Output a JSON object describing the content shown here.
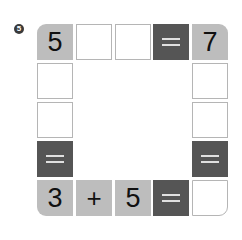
{
  "problem": {
    "number_badge": "5",
    "grid": {
      "rows": 5,
      "cols": 5,
      "cells": [
        {
          "row": 0,
          "col": 0,
          "type": "number",
          "value": "5",
          "corner": "tl"
        },
        {
          "row": 0,
          "col": 1,
          "type": "blank",
          "value": ""
        },
        {
          "row": 0,
          "col": 2,
          "type": "blank",
          "value": ""
        },
        {
          "row": 0,
          "col": 3,
          "type": "equals",
          "value": "="
        },
        {
          "row": 0,
          "col": 4,
          "type": "number",
          "value": "7",
          "corner": "tr"
        },
        {
          "row": 1,
          "col": 0,
          "type": "blank",
          "value": ""
        },
        {
          "row": 1,
          "col": 4,
          "type": "blank",
          "value": ""
        },
        {
          "row": 2,
          "col": 0,
          "type": "blank",
          "value": ""
        },
        {
          "row": 2,
          "col": 4,
          "type": "blank",
          "value": ""
        },
        {
          "row": 3,
          "col": 0,
          "type": "equals",
          "value": "="
        },
        {
          "row": 3,
          "col": 4,
          "type": "equals",
          "value": "="
        },
        {
          "row": 4,
          "col": 0,
          "type": "number",
          "value": "3",
          "corner": "bl"
        },
        {
          "row": 4,
          "col": 1,
          "type": "operator",
          "value": "+"
        },
        {
          "row": 4,
          "col": 2,
          "type": "number",
          "value": "5"
        },
        {
          "row": 4,
          "col": 3,
          "type": "equals",
          "value": "="
        },
        {
          "row": 4,
          "col": 4,
          "type": "blank",
          "value": "",
          "corner": "br"
        }
      ]
    },
    "colors": {
      "number_cell": "#bdbdbd",
      "equals_cell": "#555555",
      "blank_border": "#b5b5b5"
    }
  }
}
